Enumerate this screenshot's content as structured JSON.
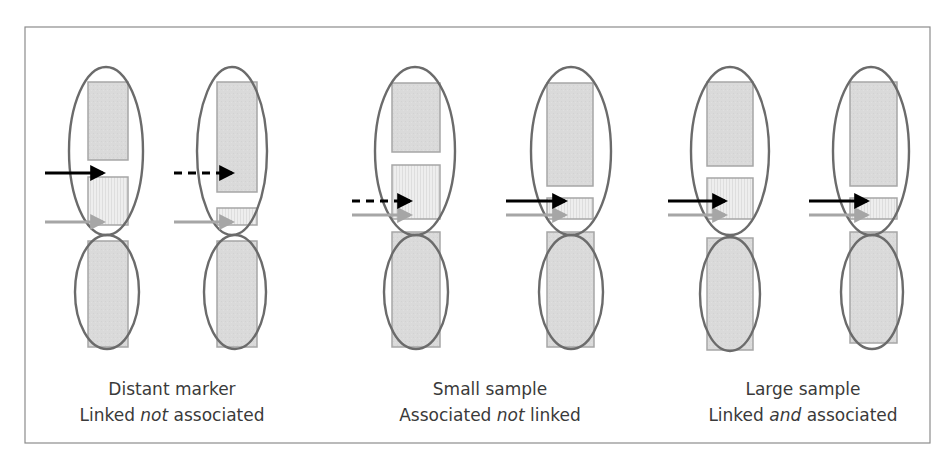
{
  "frame": {
    "x": 25,
    "y": 27,
    "w": 905,
    "h": 416
  },
  "colors": {
    "frame_stroke": "#8c8c8c",
    "rect_fill": "#d9d9d9",
    "rect_striped_fill": "#ececec",
    "rect_stroke": "#a6a6a6",
    "ellipse_stroke": "#6b6b6b",
    "arrow_black": "#000000",
    "arrow_grey": "#a6a6a6",
    "caption_text": "#3a3a3a"
  },
  "groups": [
    {
      "name": "distant-marker",
      "caption": {
        "line1": "Distant marker",
        "line2_pre": "Linked ",
        "line2_em": "not",
        "line2_post": " associated",
        "cx": 172
      },
      "columns": [
        {
          "top_rect": {
            "x": 88,
            "y": 82,
            "w": 40,
            "h": 78
          },
          "mid_rect": {
            "x": 88,
            "y": 177,
            "w": 40,
            "h": 48
          },
          "bottom_rect": {
            "x": 88,
            "y": 241,
            "w": 40,
            "h": 106
          },
          "top_ellipse": {
            "cx": 106,
            "cy": 151,
            "rx": 37,
            "ry": 84
          },
          "bottom_ellipse": {
            "cx": 107,
            "cy": 292,
            "rx": 32,
            "ry": 57
          },
          "black_arrow": {
            "x1": 45,
            "x2": 113,
            "y": 173,
            "dashed": false
          },
          "grey_arrow": {
            "x1": 45,
            "x2": 113,
            "y": 222
          }
        },
        {
          "top_rect": {
            "x": 217,
            "y": 82,
            "w": 40,
            "h": 110
          },
          "mid_rect": {
            "x": 217,
            "y": 208,
            "w": 40,
            "h": 17
          },
          "bottom_rect": {
            "x": 217,
            "y": 241,
            "w": 40,
            "h": 106
          },
          "top_ellipse": {
            "cx": 232,
            "cy": 151,
            "rx": 35,
            "ry": 84
          },
          "bottom_ellipse": {
            "cx": 235,
            "cy": 292,
            "rx": 31,
            "ry": 57
          },
          "black_arrow": {
            "x1": 174,
            "x2": 242,
            "y": 173,
            "dashed": true
          },
          "grey_arrow": {
            "x1": 174,
            "x2": 242,
            "y": 222
          }
        }
      ]
    },
    {
      "name": "small-sample",
      "caption": {
        "line1": "Small sample",
        "line2_pre": "Associated ",
        "line2_em": "not",
        "line2_post": " linked",
        "cx": 490
      },
      "columns": [
        {
          "top_rect": {
            "x": 392,
            "y": 83,
            "w": 48,
            "h": 69
          },
          "mid_rect": {
            "x": 392,
            "y": 165,
            "w": 48,
            "h": 54
          },
          "bottom_rect": {
            "x": 392,
            "y": 232,
            "w": 48,
            "h": 115
          },
          "top_ellipse": {
            "cx": 415,
            "cy": 151,
            "rx": 40,
            "ry": 84
          },
          "bottom_ellipse": {
            "cx": 416,
            "cy": 292,
            "rx": 32,
            "ry": 57
          },
          "black_arrow": {
            "x1": 352,
            "x2": 420,
            "y": 201,
            "dashed": true
          },
          "grey_arrow": {
            "x1": 352,
            "x2": 420,
            "y": 215
          }
        },
        {
          "top_rect": {
            "x": 547,
            "y": 83,
            "w": 46,
            "h": 103
          },
          "mid_rect": {
            "x": 547,
            "y": 198,
            "w": 46,
            "h": 21
          },
          "bottom_rect": {
            "x": 547,
            "y": 232,
            "w": 47,
            "h": 115
          },
          "top_ellipse": {
            "cx": 571,
            "cy": 151,
            "rx": 40,
            "ry": 84
          },
          "bottom_ellipse": {
            "cx": 571,
            "cy": 292,
            "rx": 32,
            "ry": 57
          },
          "black_arrow": {
            "x1": 506,
            "x2": 575,
            "y": 201,
            "dashed": false
          },
          "grey_arrow": {
            "x1": 506,
            "x2": 575,
            "y": 215
          }
        }
      ]
    },
    {
      "name": "large-sample",
      "caption": {
        "line1": "Large sample",
        "line2_pre": "Linked ",
        "line2_em": "and",
        "line2_post": " associated",
        "cx": 803
      },
      "columns": [
        {
          "top_rect": {
            "x": 707,
            "y": 82,
            "w": 46,
            "h": 84
          },
          "mid_rect": {
            "x": 707,
            "y": 178,
            "w": 46,
            "h": 41
          },
          "bottom_rect": {
            "x": 707,
            "y": 238,
            "w": 46,
            "h": 112
          },
          "top_ellipse": {
            "cx": 730,
            "cy": 151,
            "rx": 39,
            "ry": 84
          },
          "bottom_ellipse": {
            "cx": 730,
            "cy": 294,
            "rx": 30,
            "ry": 57
          },
          "black_arrow": {
            "x1": 668,
            "x2": 735,
            "y": 201,
            "dashed": false
          },
          "grey_arrow": {
            "x1": 668,
            "x2": 735,
            "y": 215
          }
        },
        {
          "top_rect": {
            "x": 850,
            "y": 82,
            "w": 47,
            "h": 104
          },
          "mid_rect": {
            "x": 850,
            "y": 198,
            "w": 47,
            "h": 21
          },
          "bottom_rect": {
            "x": 850,
            "y": 232,
            "w": 47,
            "h": 111
          },
          "top_ellipse": {
            "cx": 871,
            "cy": 151,
            "rx": 38,
            "ry": 84
          },
          "bottom_ellipse": {
            "cx": 872,
            "cy": 292,
            "rx": 31,
            "ry": 57
          },
          "black_arrow": {
            "x1": 809,
            "x2": 877,
            "y": 201,
            "dashed": false
          },
          "grey_arrow": {
            "x1": 809,
            "x2": 877,
            "y": 215
          }
        }
      ]
    }
  ]
}
